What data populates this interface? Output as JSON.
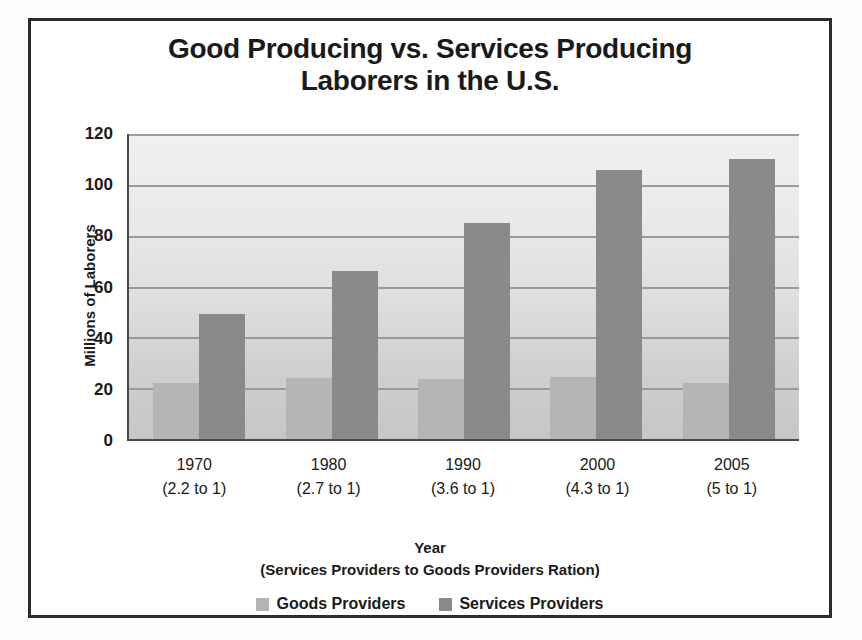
{
  "chart_data": {
    "type": "bar",
    "title": "Good Producing vs. Services Producing Laborers in the U.S.",
    "title_lines": [
      "Good Producing vs. Services Producing",
      "Laborers in the U.S."
    ],
    "categories": [
      "1970",
      "1980",
      "1990",
      "2000",
      "2005"
    ],
    "category_sublabels": [
      "(2.2 to 1)",
      "(2.7 to 1)",
      "(3.6 to 1)",
      "(4.3 to 1)",
      "(5 to 1)"
    ],
    "series": [
      {
        "name": "Goods Providers",
        "color": "#b5b5b5",
        "values": [
          22,
          24,
          23.5,
          24.5,
          22
        ]
      },
      {
        "name": "Services Providers",
        "color": "#8a8a8a",
        "values": [
          49,
          66,
          85,
          106,
          110
        ]
      }
    ],
    "ylabel": "Millions of Laborers",
    "xlabel": "Year",
    "xlabel_sub": "(Services Providers to Goods Providers Ration)",
    "ylim": [
      0,
      120
    ],
    "ytick_step": 20,
    "yticks": [
      "0",
      "20",
      "40",
      "60",
      "80",
      "100",
      "120"
    ],
    "grid": true,
    "legend_position": "bottom",
    "plot_bg_color": "#e2e2e2",
    "frame_color": "#2b2b2b",
    "axis_color": "#4a4a4a",
    "gridline_color": "#9a9a9a",
    "text_color": "#1a1a1a"
  }
}
